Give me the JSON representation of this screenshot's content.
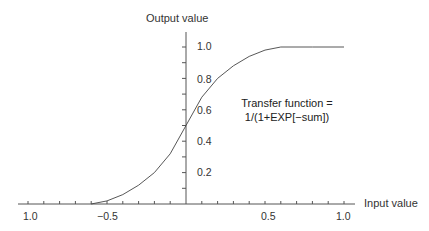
{
  "chart_data": {
    "type": "line",
    "title": "",
    "xlabel": "Input value",
    "ylabel": "Output  value",
    "annotation": [
      "Transfer function =",
      "1/(1+EXP[−sum])"
    ],
    "x_tick_labels": [
      "1.0",
      "−0.5",
      "0.5",
      "1.0"
    ],
    "x_tick_values": [
      -1.0,
      -0.5,
      0.5,
      1.0
    ],
    "y_tick_labels": [
      "0.2",
      "0.4",
      "0.6",
      "0.8",
      "1.0"
    ],
    "y_tick_values": [
      0.2,
      0.4,
      0.6,
      0.8,
      1.0
    ],
    "xlim": [
      -1.0,
      1.0
    ],
    "ylim": [
      0,
      1.0
    ],
    "grid": false,
    "series": [
      {
        "name": "Transfer function",
        "x": [
          -0.6,
          -0.5,
          -0.4,
          -0.3,
          -0.2,
          -0.1,
          0.0,
          0.1,
          0.2,
          0.3,
          0.4,
          0.5,
          0.6,
          0.8,
          1.0
        ],
        "y": [
          0.0,
          0.02,
          0.06,
          0.12,
          0.2,
          0.32,
          0.5,
          0.68,
          0.8,
          0.88,
          0.94,
          0.98,
          1.0,
          1.0,
          1.0
        ]
      }
    ]
  }
}
